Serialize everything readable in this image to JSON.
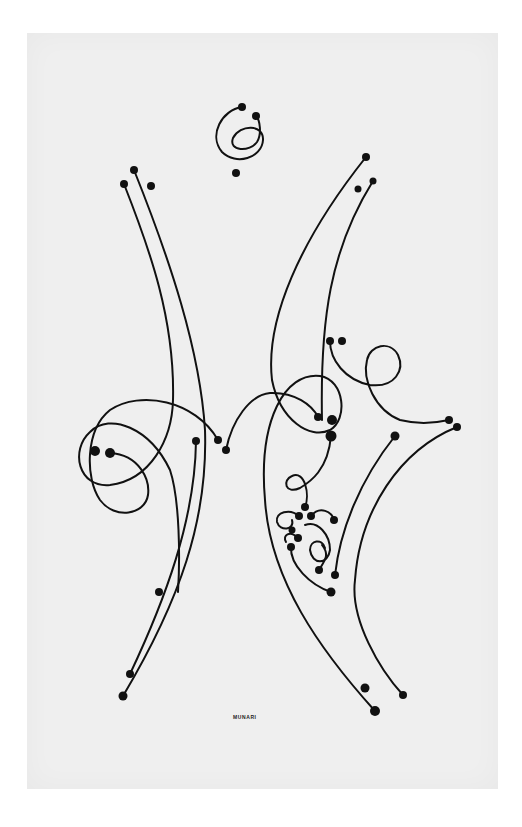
{
  "artwork": {
    "signature": "MUNARI",
    "colors": {
      "background": "#ffffff",
      "paper": "#efefef",
      "ink": "#111111"
    }
  }
}
